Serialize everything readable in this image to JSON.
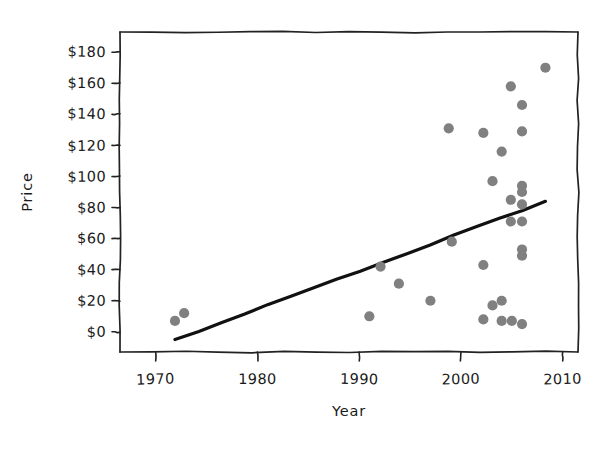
{
  "chart_data": {
    "type": "scatter",
    "title": "",
    "xlabel": "Year",
    "ylabel": "Price",
    "xlim": [
      1966.5,
      2011.5
    ],
    "ylim": [
      -13,
      193
    ],
    "grid": false,
    "legend": null,
    "style": "hand-drawn",
    "point_color": "#808080",
    "line_color": "#111111",
    "xticks": [
      1970,
      1980,
      1990,
      2000,
      2010
    ],
    "xtick_labels": [
      "1970",
      "1980",
      "1990",
      "2000",
      "2010"
    ],
    "yticks": [
      0,
      20,
      40,
      60,
      80,
      100,
      120,
      140,
      160,
      180
    ],
    "ytick_labels": [
      "$0",
      "$20",
      "$40",
      "$60",
      "$80",
      "$100",
      "$120",
      "$140",
      "$160",
      "$180"
    ],
    "points": [
      {
        "x": 1971.9,
        "y": 7
      },
      {
        "x": 1972.8,
        "y": 12
      },
      {
        "x": 1991.0,
        "y": 10
      },
      {
        "x": 1992.1,
        "y": 42
      },
      {
        "x": 1993.9,
        "y": 31
      },
      {
        "x": 1997.0,
        "y": 20
      },
      {
        "x": 1998.8,
        "y": 131
      },
      {
        "x": 1999.1,
        "y": 58
      },
      {
        "x": 2002.2,
        "y": 128
      },
      {
        "x": 2002.2,
        "y": 43
      },
      {
        "x": 2002.2,
        "y": 8
      },
      {
        "x": 2003.1,
        "y": 97
      },
      {
        "x": 2003.1,
        "y": 17
      },
      {
        "x": 2004.0,
        "y": 116
      },
      {
        "x": 2004.0,
        "y": 20
      },
      {
        "x": 2004.0,
        "y": 7
      },
      {
        "x": 2004.9,
        "y": 158
      },
      {
        "x": 2004.9,
        "y": 85
      },
      {
        "x": 2004.9,
        "y": 71
      },
      {
        "x": 2005.0,
        "y": 7
      },
      {
        "x": 2006.0,
        "y": 146
      },
      {
        "x": 2006.0,
        "y": 129
      },
      {
        "x": 2006.0,
        "y": 94
      },
      {
        "x": 2006.0,
        "y": 90
      },
      {
        "x": 2006.0,
        "y": 82
      },
      {
        "x": 2006.0,
        "y": 71
      },
      {
        "x": 2006.0,
        "y": 53
      },
      {
        "x": 2006.0,
        "y": 49
      },
      {
        "x": 2006.0,
        "y": 5
      },
      {
        "x": 2008.3,
        "y": 170
      }
    ],
    "trend_line": {
      "x0": 1971.9,
      "y0": -5,
      "x1": 2008.3,
      "y1": 84
    }
  }
}
